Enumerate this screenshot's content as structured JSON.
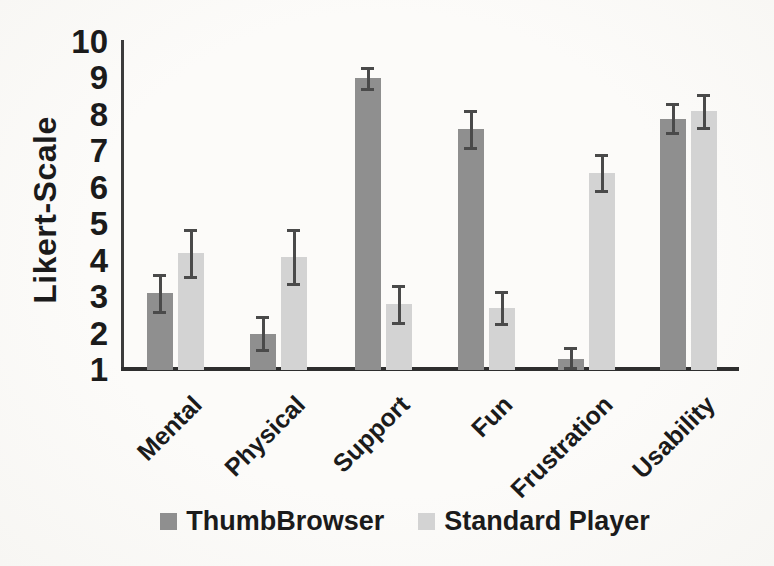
{
  "chart_data": {
    "type": "bar",
    "title": "",
    "xlabel": "",
    "ylabel": "Likert-Scale",
    "ylim": [
      1,
      10
    ],
    "yticks": [
      1,
      2,
      3,
      4,
      5,
      6,
      7,
      8,
      9,
      10
    ],
    "grid": false,
    "legend_position": "bottom",
    "categories": [
      "Mental",
      "Physical",
      "Support",
      "Fun",
      "Frustration",
      "Usability"
    ],
    "series": [
      {
        "name": "ThumbBrowser",
        "color": "#8f8f8f",
        "values": [
          3.1,
          2.0,
          9.0,
          7.6,
          1.3,
          7.9
        ],
        "errors": [
          0.5,
          0.45,
          0.3,
          0.5,
          0.3,
          0.4
        ]
      },
      {
        "name": "Standard Player",
        "color": "#d3d3d3",
        "values": [
          4.2,
          4.1,
          2.8,
          2.7,
          6.4,
          8.1
        ],
        "errors": [
          0.65,
          0.75,
          0.5,
          0.45,
          0.5,
          0.45
        ]
      }
    ],
    "axis_color": "#3c3c3c",
    "error_bar_color": "#4a4a4a",
    "text_color": "#1b1b1b"
  }
}
